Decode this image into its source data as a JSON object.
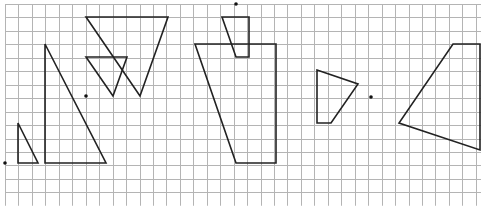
{
  "diagram": {
    "type": "grid-geometry",
    "width": 481,
    "height": 206,
    "grid": {
      "origin_x": 5,
      "origin_y": 4,
      "cell": 13.45,
      "columns": 36,
      "rows": 15,
      "line_color": "#b4b4b4"
    },
    "stroke_color": "#222222",
    "shapes": [
      {
        "name": "small-right-triangle",
        "points": [
          [
            18,
            123
          ],
          [
            18,
            163
          ],
          [
            38,
            163
          ]
        ]
      },
      {
        "name": "large-right-triangle",
        "points": [
          [
            45,
            44
          ],
          [
            45,
            163
          ],
          [
            106,
            163
          ]
        ]
      },
      {
        "name": "large-inverted-triangle",
        "points": [
          [
            86,
            17
          ],
          [
            168,
            17
          ],
          [
            140,
            96
          ]
        ]
      },
      {
        "name": "small-inverted-triangle",
        "points": [
          [
            86,
            57
          ],
          [
            127,
            57
          ],
          [
            113,
            96
          ]
        ]
      },
      {
        "name": "small-quadrilateral",
        "points": [
          [
            222,
            17
          ],
          [
            249,
            17
          ],
          [
            249,
            57
          ],
          [
            236,
            57
          ]
        ]
      },
      {
        "name": "large-trapezoid",
        "points": [
          [
            195,
            44
          ],
          [
            276,
            44
          ],
          [
            276,
            163
          ],
          [
            236,
            163
          ]
        ]
      },
      {
        "name": "right-quadrilateral-small",
        "points": [
          [
            317,
            70
          ],
          [
            358,
            84
          ],
          [
            331,
            123
          ],
          [
            317,
            123
          ]
        ]
      },
      {
        "name": "right-quadrilateral-large",
        "points": [
          [
            453,
            44
          ],
          [
            480,
            44
          ],
          [
            480,
            150
          ],
          [
            399,
            123
          ]
        ]
      }
    ],
    "points": [
      {
        "name": "rotation-center-left",
        "x": 5,
        "y": 163
      },
      {
        "name": "rotation-center-mid-left",
        "x": 86,
        "y": 96
      },
      {
        "name": "rotation-center-top",
        "x": 236,
        "y": 4
      },
      {
        "name": "rotation-center-right",
        "x": 371,
        "y": 97
      }
    ]
  }
}
